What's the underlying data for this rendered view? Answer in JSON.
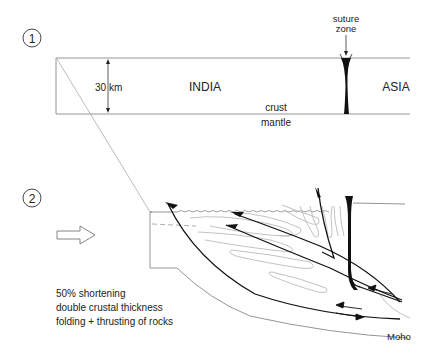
{
  "stage1": {
    "number": "1",
    "thickness_label": "30 km",
    "india_label": "INDIA",
    "asia_label": "ASIA",
    "crust_label": "crust",
    "mantle_label": "mantle",
    "suture_label_line1": "suture",
    "suture_label_line2": "zone"
  },
  "stage2": {
    "number": "2",
    "notes": [
      "50% shortening",
      "double crustal thickness",
      "folding + thrusting of rocks"
    ],
    "moho_label": "Moho"
  },
  "colors": {
    "line": "#111111",
    "fold": "#bbbbbb",
    "frame": "#888888"
  }
}
